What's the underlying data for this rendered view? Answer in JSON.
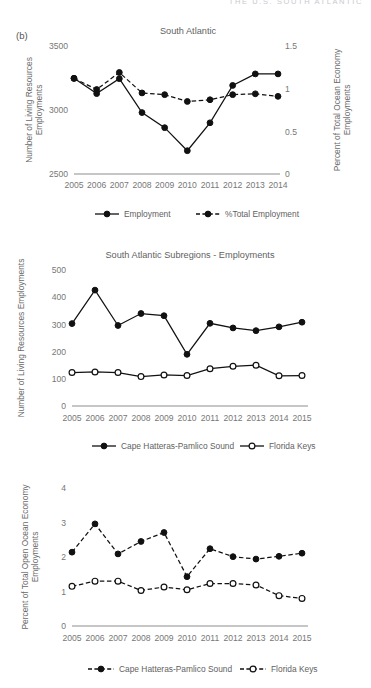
{
  "running_head": "THE U.S. SOUTH ATLANTIC",
  "panel_label": "(b)",
  "legend_labels": {
    "employment": "Employment",
    "pct_total_employment": "%Total Employment",
    "cape": "Cape Hatteras-Pamlico Sound",
    "keys": "Florida Keys"
  },
  "chart_data": [
    {
      "id": "south-atlantic",
      "type": "line",
      "title": "South Atlantic",
      "categories": [
        "2005",
        "2006",
        "2007",
        "2008",
        "2009",
        "2010",
        "2011",
        "2012",
        "2013",
        "2014"
      ],
      "xlabel": "",
      "ylabel": "Number of Living Resources Employments",
      "ylim": [
        2500,
        3500
      ],
      "yticks": [
        2500,
        3000,
        3500
      ],
      "ytick_labels": [
        "2500",
        "3000",
        "3500"
      ],
      "y2label": "Percent of Total Ocean Economy Employments",
      "y2lim": [
        0,
        1.5
      ],
      "y2ticks": [
        0,
        0.5,
        1,
        1.5
      ],
      "y2tick_labels": [
        "0",
        "0.5",
        "1",
        "1.5"
      ],
      "grid": false,
      "legend_position": "bottom",
      "series": [
        {
          "name": "Employment",
          "axis": "left",
          "style": "solid",
          "marker": "filled",
          "values": [
            3248,
            3128,
            3245,
            2980,
            2862,
            2682,
            2900,
            3192,
            3282,
            3282
          ]
        },
        {
          "name": "%Total Employment",
          "axis": "right",
          "style": "dashed",
          "marker": "filled",
          "values": [
            1.12,
            0.99,
            1.19,
            0.95,
            0.93,
            0.85,
            0.87,
            0.93,
            0.94,
            0.91
          ]
        }
      ]
    },
    {
      "id": "subregions-employments",
      "type": "line",
      "title": "South Atlantic Subregions - Employments",
      "categories": [
        "2005",
        "2006",
        "2007",
        "2008",
        "2009",
        "2010",
        "2011",
        "2012",
        "2013",
        "2014",
        "2015"
      ],
      "xlabel": "",
      "ylabel": "Number of Living Resources Employments",
      "ylim": [
        0,
        500
      ],
      "yticks": [
        0,
        100,
        200,
        300,
        400,
        500
      ],
      "ytick_labels": [
        "0",
        "100",
        "200",
        "300",
        "400",
        "500"
      ],
      "grid": false,
      "legend_position": "bottom",
      "series": [
        {
          "name": "Cape Hatteras-Pamlico Sound",
          "style": "solid",
          "marker": "filled",
          "values": [
            303,
            426,
            296,
            340,
            332,
            190,
            304,
            287,
            277,
            291,
            308
          ]
        },
        {
          "name": "Florida Keys",
          "style": "solid",
          "marker": "open",
          "values": [
            123,
            125,
            123,
            108,
            114,
            112,
            137,
            146,
            150,
            111,
            112
          ]
        }
      ]
    },
    {
      "id": "subregions-percent",
      "type": "line",
      "title": "",
      "categories": [
        "2005",
        "2006",
        "2007",
        "2008",
        "2009",
        "2010",
        "2011",
        "2012",
        "2013",
        "2014",
        "2015"
      ],
      "xlabel": "",
      "ylabel": "Percent of Total Open Ocean Economy Employments",
      "ylim": [
        0,
        4
      ],
      "yticks": [
        0,
        1,
        2,
        3,
        4
      ],
      "ytick_labels": [
        "0",
        "1",
        "2",
        "3",
        "4"
      ],
      "grid": false,
      "legend_position": "bottom",
      "series": [
        {
          "name": "Cape Hatteras-Pamlico Sound",
          "style": "dashed",
          "marker": "filled",
          "values": [
            2.14,
            2.96,
            2.09,
            2.45,
            2.71,
            1.43,
            2.24,
            2.01,
            1.94,
            2.02,
            2.11
          ]
        },
        {
          "name": "Florida Keys",
          "style": "dashed",
          "marker": "open",
          "values": [
            1.15,
            1.3,
            1.3,
            1.03,
            1.13,
            1.05,
            1.23,
            1.23,
            1.19,
            0.88,
            0.8
          ]
        }
      ]
    }
  ]
}
